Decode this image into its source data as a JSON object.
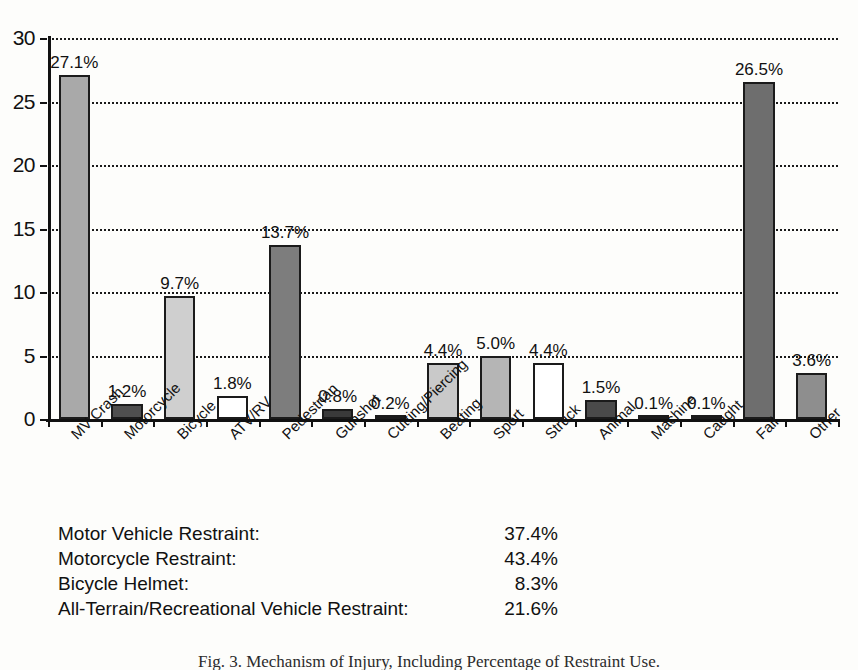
{
  "chart_data": {
    "type": "bar",
    "title": "",
    "xlabel": "",
    "ylabel": "",
    "ylim": [
      0,
      30
    ],
    "yticks": [
      0,
      5,
      10,
      15,
      20,
      25,
      30
    ],
    "grid": true,
    "legend": "none",
    "value_suffix": "%",
    "categories": [
      "MV Crash",
      "Motorcycle",
      "Bicycle",
      "ATV/RV",
      "Pedestrian",
      "Gunshot",
      "Cutting/Piercing",
      "Beating",
      "Sport",
      "Struck",
      "Animal",
      "Machine",
      "Caught",
      "Fall",
      "Other"
    ],
    "values": [
      27.1,
      1.2,
      9.7,
      1.8,
      13.7,
      0.8,
      0.2,
      4.4,
      5.0,
      4.4,
      1.5,
      0.1,
      0.1,
      26.5,
      3.6
    ],
    "value_labels": [
      "27.1%",
      "1.2%",
      "9.7%",
      "1.8%",
      "13.7%",
      "0.8%",
      "0.2%",
      "4.4%",
      "5.0%",
      "4.4%",
      "1.5%",
      "0.1%",
      "0.1%",
      "26.5%",
      "3.6%"
    ],
    "bar_fills": [
      "#a9a9a9",
      "#4f4f4f",
      "#cfcfcf",
      "#ffffff",
      "#7d7d7d",
      "#3a3a3a",
      "#d9d9d9",
      "#c9c9c9",
      "#b5b5b5",
      "#ffffff",
      "#4a4a4a",
      "#e8e8e8",
      "#dcdcdc",
      "#6e6e6e",
      "#8e8e8e"
    ],
    "bar_edge_color": "#1b1b1b",
    "grid_color": "#1a1a1a",
    "axis_color": "#111111"
  },
  "restraint": {
    "rows": [
      {
        "label": "Motor Vehicle Restraint:",
        "value": "37.4%"
      },
      {
        "label": "Motorcycle Restraint:",
        "value": "43.4%"
      },
      {
        "label": "Bicycle Helmet:",
        "value": "8.3%"
      },
      {
        "label": "All-Terrain/Recreational Vehicle Restraint:",
        "value": "21.6%"
      }
    ]
  },
  "caption": {
    "text": "Fig. 3.  Mechanism of Injury, Including Percentage of Restraint Use."
  }
}
